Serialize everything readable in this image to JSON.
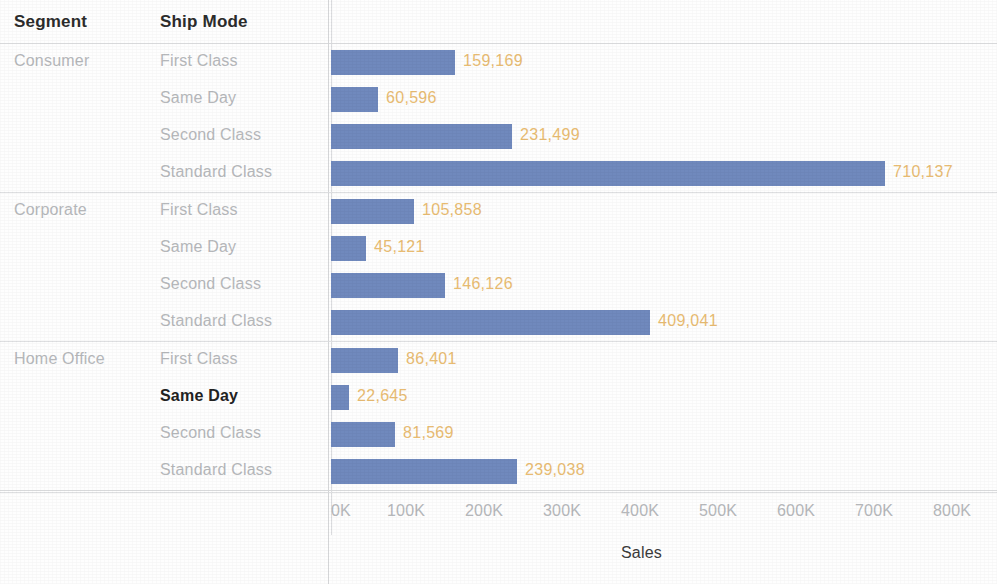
{
  "header": {
    "segment_label": "Segment",
    "ship_mode_label": "Ship Mode"
  },
  "axis": {
    "title": "Sales",
    "ticks": [
      "0K",
      "100K",
      "200K",
      "300K",
      "400K",
      "500K",
      "600K",
      "700K",
      "800K"
    ]
  },
  "colors": {
    "bar": "#7089bd",
    "value_label": "#e9bc72",
    "row_label": "#b6b8bb",
    "header_text": "#2c2c2c",
    "highlight_text": "#222222",
    "gridline": "#dedfe1",
    "background": "#fefefe"
  },
  "groups": [
    {
      "segment": "Consumer",
      "rows": [
        {
          "ship_mode": "First Class",
          "value": 159169,
          "value_label": "159,169",
          "highlighted": false
        },
        {
          "ship_mode": "Same Day",
          "value": 60596,
          "value_label": "60,596",
          "highlighted": false
        },
        {
          "ship_mode": "Second Class",
          "value": 231499,
          "value_label": "231,499",
          "highlighted": false
        },
        {
          "ship_mode": "Standard Class",
          "value": 710137,
          "value_label": "710,137",
          "highlighted": false
        }
      ]
    },
    {
      "segment": "Corporate",
      "rows": [
        {
          "ship_mode": "First Class",
          "value": 105858,
          "value_label": "105,858",
          "highlighted": false
        },
        {
          "ship_mode": "Same Day",
          "value": 45121,
          "value_label": "45,121",
          "highlighted": false
        },
        {
          "ship_mode": "Second Class",
          "value": 146126,
          "value_label": "146,126",
          "highlighted": false
        },
        {
          "ship_mode": "Standard Class",
          "value": 409041,
          "value_label": "409,041",
          "highlighted": false
        }
      ]
    },
    {
      "segment": "Home Office",
      "rows": [
        {
          "ship_mode": "First Class",
          "value": 86401,
          "value_label": "86,401",
          "highlighted": false
        },
        {
          "ship_mode": "Same Day",
          "value": 22645,
          "value_label": "22,645",
          "highlighted": true
        },
        {
          "ship_mode": "Second Class",
          "value": 81569,
          "value_label": "81,569",
          "highlighted": false
        },
        {
          "ship_mode": "Standard Class",
          "value": 239038,
          "value_label": "239,038",
          "highlighted": false
        }
      ]
    }
  ],
  "chart_data": {
    "type": "bar",
    "orientation": "horizontal",
    "title": "",
    "xlabel": "Sales",
    "ylabel": "",
    "xlim": [
      0,
      800000
    ],
    "xticks": [
      0,
      100000,
      200000,
      300000,
      400000,
      500000,
      600000,
      700000,
      800000
    ],
    "xtick_labels": [
      "0K",
      "100K",
      "200K",
      "300K",
      "400K",
      "500K",
      "600K",
      "700K",
      "800K"
    ],
    "grid": false,
    "legend": "none",
    "data_labels": true,
    "bar_color": "#7089bd",
    "label_color": "#e9bc72",
    "dimensions": [
      "Segment",
      "Ship Mode"
    ],
    "measure": "Sales",
    "categories": [
      "Consumer / First Class",
      "Consumer / Same Day",
      "Consumer / Second Class",
      "Consumer / Standard Class",
      "Corporate / First Class",
      "Corporate / Same Day",
      "Corporate / Second Class",
      "Corporate / Standard Class",
      "Home Office / First Class",
      "Home Office / Same Day",
      "Home Office / Second Class",
      "Home Office / Standard Class"
    ],
    "values": [
      159169,
      60596,
      231499,
      710137,
      105858,
      45121,
      146126,
      409041,
      86401,
      22645,
      81569,
      239038
    ],
    "annotations": [
      "Home Office / Same Day row label is bolded/highlighted"
    ]
  }
}
